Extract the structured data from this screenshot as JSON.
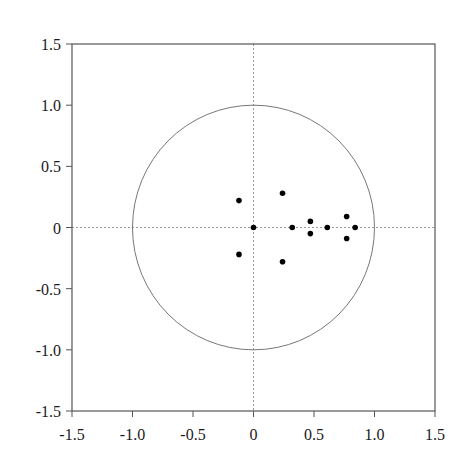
{
  "chart_data": {
    "type": "scatter",
    "title": "",
    "xlabel": "",
    "ylabel": "",
    "xlim": [
      -1.5,
      1.5
    ],
    "ylim": [
      -1.5,
      1.5
    ],
    "grid": false,
    "legend": null,
    "x_ticks": [
      -1.5,
      -1.0,
      -0.5,
      0,
      0.5,
      1.0,
      1.5
    ],
    "y_ticks": [
      1.5,
      1.0,
      0.5,
      0,
      -0.5,
      -1.0,
      -1.5
    ],
    "x_tick_labels": [
      "-1.5",
      "-1.0",
      "-0.5",
      "0",
      "0.5",
      "1.0",
      "1.5"
    ],
    "y_tick_labels": [
      "1.5",
      "1.0",
      "0.5",
      "0",
      "-0.5",
      "-1.0",
      "-1.5"
    ],
    "annotations": [
      {
        "type": "unit-circle",
        "center": [
          0,
          0
        ],
        "radius": 1.0
      },
      {
        "type": "dashed-reference-line",
        "orientation": "horizontal",
        "value": 0
      },
      {
        "type": "dashed-reference-line",
        "orientation": "vertical",
        "value": 0
      }
    ],
    "series": [
      {
        "name": "roots",
        "points": [
          {
            "x": -0.12,
            "y": 0.22
          },
          {
            "x": -0.12,
            "y": -0.22
          },
          {
            "x": 0.0,
            "y": 0.0
          },
          {
            "x": 0.24,
            "y": 0.28
          },
          {
            "x": 0.24,
            "y": -0.28
          },
          {
            "x": 0.32,
            "y": 0.0
          },
          {
            "x": 0.47,
            "y": 0.05
          },
          {
            "x": 0.47,
            "y": -0.05
          },
          {
            "x": 0.61,
            "y": 0.0
          },
          {
            "x": 0.77,
            "y": 0.09
          },
          {
            "x": 0.77,
            "y": -0.09
          },
          {
            "x": 0.84,
            "y": 0.0
          }
        ]
      }
    ]
  },
  "colors": {
    "axis": "#555555",
    "circle": "#777777",
    "reference_line": "#999999",
    "marker": "#000000",
    "text": "#1a1a1a"
  }
}
